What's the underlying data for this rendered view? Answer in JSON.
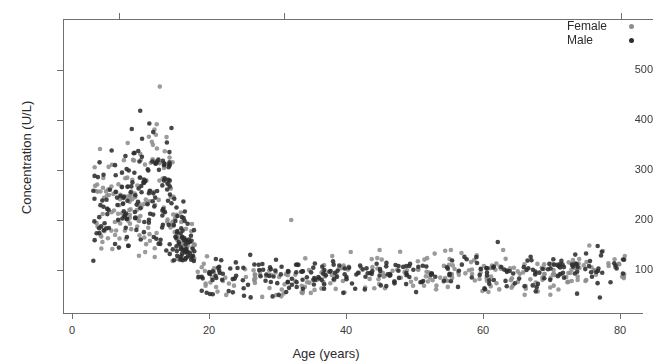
{
  "chart_data": {
    "type": "scatter",
    "title": "",
    "xlabel": "Age (years)",
    "ylabel": "Concentration (U/L)",
    "xlim": [
      0,
      84
    ],
    "ylim": [
      0,
      560
    ],
    "xticks": [
      0,
      20,
      40,
      60,
      80
    ],
    "yticks": [
      100,
      200,
      300,
      400,
      500
    ],
    "xtick_labels": [
      "0",
      "20",
      "40",
      "60",
      "80"
    ],
    "ytick_labels": [
      "100",
      "200",
      "300",
      "400",
      "500"
    ],
    "grid": false,
    "legend_position": "top-right",
    "marker": "filled-circle",
    "marker_size_px": 4.6,
    "series": [
      {
        "name": "Female",
        "color": "#8d8d8d",
        "marker_color": "#8d8d8d",
        "n_points": 430,
        "description": "Lighter grey filled circles; high scattered values in childhood peaking near 480 U/L around ages 10-13, dropping sharply after age 15 to a narrow adult band near 60-130 U/L; one isolated point near age 32 at about 200 U/L"
      },
      {
        "name": "Male",
        "color": "#2e2e2e",
        "marker_color": "#2e2e2e",
        "n_points": 470,
        "description": "Dark near-black filled circles; broad childhood scatter 150-480 U/L peaking around ages 11-14, falling after age 16 into a tight adult band near 50-135 U/L across ages 20-80"
      }
    ],
    "annotations": [
      {
        "text": "isolated female point",
        "x": 32,
        "y": 200
      }
    ],
    "summary_profile": {
      "child_age_range": [
        3,
        18
      ],
      "child_value_range": [
        120,
        485
      ],
      "adult_age_range": [
        18,
        81
      ],
      "adult_value_range": [
        40,
        160
      ],
      "peak_value": 485,
      "peak_age": 11
    }
  },
  "axes": {
    "y_title": "Concentration (U/L)",
    "x_title": "Age (years)"
  },
  "legend": {
    "items": [
      {
        "label": "Female",
        "color": "#8d8d8d"
      },
      {
        "label": "Male",
        "color": "#2e2e2e"
      }
    ]
  }
}
